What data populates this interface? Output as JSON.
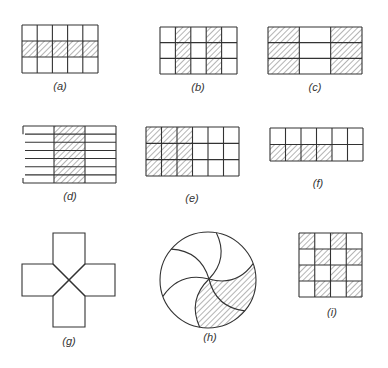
{
  "figures": [
    {
      "id": "a",
      "label": "(a)",
      "type": "grid",
      "x": 22,
      "y": 25,
      "w": 76,
      "h": 48,
      "cols": 5,
      "rows": 3,
      "shaded": [
        [
          1,
          0
        ],
        [
          1,
          1
        ],
        [
          1,
          2
        ],
        [
          1,
          3
        ],
        [
          1,
          4
        ]
      ],
      "label_x": 60,
      "label_y": 90
    },
    {
      "id": "b",
      "label": "(b)",
      "type": "grid",
      "x": 160,
      "y": 27,
      "w": 77,
      "h": 47,
      "cols": 5,
      "rows": 3,
      "shaded": [
        [
          0,
          1
        ],
        [
          1,
          1
        ],
        [
          2,
          1
        ],
        [
          0,
          3
        ],
        [
          1,
          3
        ],
        [
          2,
          3
        ]
      ],
      "label_x": 198,
      "label_y": 91
    },
    {
      "id": "c",
      "label": "(c)",
      "type": "grid",
      "x": 268,
      "y": 27,
      "w": 94,
      "h": 47,
      "cols": 3,
      "rows": 3,
      "shaded": [
        [
          0,
          0
        ],
        [
          1,
          0
        ],
        [
          2,
          0
        ],
        [
          0,
          2
        ],
        [
          1,
          2
        ],
        [
          2,
          2
        ]
      ],
      "label_x": 315,
      "label_y": 91
    },
    {
      "id": "d",
      "label": "(d)",
      "type": "grid_partial_left",
      "x": 23,
      "y": 126,
      "w": 93,
      "h": 57,
      "cols": 3,
      "rows": 7,
      "shaded": [
        [
          0,
          1
        ],
        [
          1,
          1
        ],
        [
          2,
          1
        ],
        [
          3,
          1
        ],
        [
          4,
          1
        ],
        [
          5,
          1
        ],
        [
          6,
          1
        ]
      ],
      "label_x": 70,
      "label_y": 200
    },
    {
      "id": "e",
      "label": "(e)",
      "type": "grid",
      "x": 146,
      "y": 127,
      "w": 93,
      "h": 49,
      "cols": 6,
      "rows": 3,
      "shaded": [
        [
          0,
          0
        ],
        [
          0,
          1
        ],
        [
          0,
          2
        ],
        [
          1,
          0
        ],
        [
          1,
          1
        ],
        [
          1,
          2
        ],
        [
          2,
          0
        ],
        [
          2,
          1
        ],
        [
          2,
          2
        ]
      ],
      "label_x": 192,
      "label_y": 202
    },
    {
      "id": "f",
      "label": "(f)",
      "type": "grid",
      "x": 270,
      "y": 128,
      "w": 93,
      "h": 33,
      "cols": 6,
      "rows": 2,
      "shaded": [
        [
          1,
          0
        ],
        [
          1,
          1
        ],
        [
          1,
          2
        ],
        [
          1,
          3
        ]
      ],
      "label_x": 318,
      "label_y": 187
    },
    {
      "id": "g",
      "label": "(g)",
      "type": "cross",
      "cx": 69,
      "cy": 280,
      "arm": 16,
      "vtop": 233,
      "vbottom": 327,
      "hleft": 22,
      "hright": 115,
      "label_x": 69,
      "label_y": 345
    },
    {
      "id": "h",
      "label": "(h)",
      "type": "pinwheel",
      "cx": 208,
      "cy": 280,
      "r": 48,
      "label_x": 210,
      "label_y": 341
    },
    {
      "id": "i",
      "label": "(i)",
      "type": "grid",
      "x": 299,
      "y": 233,
      "w": 63,
      "h": 64,
      "cols": 4,
      "rows": 4,
      "shaded": [
        [
          0,
          0
        ],
        [
          0,
          2
        ],
        [
          1,
          1
        ],
        [
          1,
          3
        ],
        [
          2,
          0
        ],
        [
          2,
          2
        ],
        [
          3,
          1
        ],
        [
          3,
          3
        ]
      ],
      "label_x": 332,
      "label_y": 316
    }
  ],
  "colors": {
    "stroke": "#333333",
    "hatch": "#6a6a6a",
    "background": "#ffffff"
  }
}
